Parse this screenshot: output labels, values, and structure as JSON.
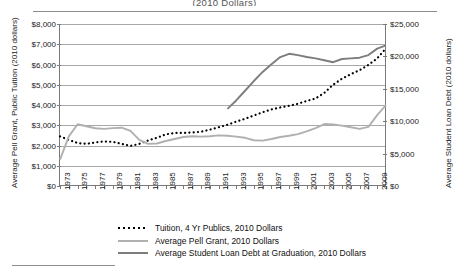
{
  "figure": {
    "title_fragment": "(2010 Dollars)",
    "top_rule": "horizontal-rule",
    "footnote_rule": "horizontal-rule"
  },
  "axes": {
    "y_left_title": "Average Pell Grant, Public Tuition (2010 dollars)",
    "y_right_title": "Average Student Loan Debt (2010 dollars)",
    "y_left_ticks": [
      "$0",
      "$1,000",
      "$2,000",
      "$3,000",
      "$4,000",
      "$5,000",
      "$6,000",
      "$7,000",
      "$8,000"
    ],
    "y_right_ticks": [
      "$0",
      "$5,000",
      "$10,000",
      "$15,000",
      "$20,000",
      "$25,000"
    ],
    "x_ticks": [
      "1973",
      "1975",
      "1977",
      "1979",
      "1981",
      "1983",
      "1985",
      "1987",
      "1989",
      "1991",
      "1993",
      "1995",
      "1997",
      "1999",
      "2001",
      "2003",
      "2005",
      "2007",
      "2009"
    ]
  },
  "legend": {
    "position": "below-plot",
    "entries": [
      {
        "label": "Tuition, 4 Yr Publics, 2010 Dollars",
        "key": "dotted",
        "color": "#000000"
      },
      {
        "label": "Average Pell Grant, 2010 Dollars",
        "key": "line",
        "color": "#b0b0b0"
      },
      {
        "label": "Average Student Loan Debt at Graduation, 2010 Dollars",
        "key": "line",
        "color": "#7d7d7d"
      }
    ]
  },
  "chart_data": {
    "type": "line",
    "title": "(2010 Dollars)",
    "xlabel": "",
    "ylabel": "Average Pell Grant, Public Tuition (2010 dollars)",
    "y2label": "Average Student Loan Debt (2010 dollars)",
    "xlim": [
      1973,
      2010
    ],
    "ylim": [
      0,
      8000
    ],
    "y2lim": [
      0,
      25000
    ],
    "grid": true,
    "legend_position": "bottom",
    "x": [
      1973,
      1974,
      1975,
      1976,
      1977,
      1978,
      1979,
      1980,
      1981,
      1982,
      1983,
      1984,
      1985,
      1986,
      1987,
      1988,
      1989,
      1990,
      1991,
      1992,
      1993,
      1994,
      1995,
      1996,
      1997,
      1998,
      1999,
      2000,
      2001,
      2002,
      2003,
      2004,
      2005,
      2006,
      2007,
      2008,
      2009,
      2010
    ],
    "series": [
      {
        "name": "Tuition, 4 Yr Publics, 2010 Dollars",
        "axis": "left",
        "style": "dotted",
        "color": "#000000",
        "values": [
          2450,
          2280,
          2120,
          2080,
          2150,
          2200,
          2180,
          2080,
          1980,
          2080,
          2250,
          2380,
          2550,
          2620,
          2620,
          2640,
          2680,
          2780,
          2900,
          3020,
          3180,
          3320,
          3480,
          3640,
          3780,
          3880,
          3960,
          4060,
          4200,
          4320,
          4600,
          5000,
          5300,
          5520,
          5720,
          5980,
          6300,
          6800
        ]
      },
      {
        "name": "Average Pell Grant, 2010 Dollars",
        "axis": "left",
        "style": "solid",
        "color": "#b0b0b0",
        "values": [
          1300,
          2450,
          3050,
          2950,
          2850,
          2820,
          2860,
          2880,
          2720,
          2280,
          2080,
          2100,
          2220,
          2320,
          2420,
          2460,
          2440,
          2460,
          2500,
          2480,
          2440,
          2380,
          2260,
          2240,
          2320,
          2420,
          2480,
          2560,
          2700,
          2860,
          3060,
          3040,
          2980,
          2900,
          2820,
          2920,
          3500,
          4000
        ]
      },
      {
        "name": "Average Student Loan Debt at Graduation, 2010 Dollars",
        "axis": "right",
        "style": "solid",
        "color": "#7d7d7d",
        "values": [
          null,
          null,
          null,
          null,
          null,
          null,
          null,
          null,
          null,
          null,
          null,
          null,
          null,
          null,
          null,
          null,
          null,
          null,
          null,
          11900,
          13200,
          14700,
          16200,
          17600,
          18800,
          19900,
          20400,
          20200,
          19900,
          19700,
          19400,
          19100,
          19600,
          19700,
          19800,
          20200,
          21200,
          21700
        ]
      }
    ]
  }
}
